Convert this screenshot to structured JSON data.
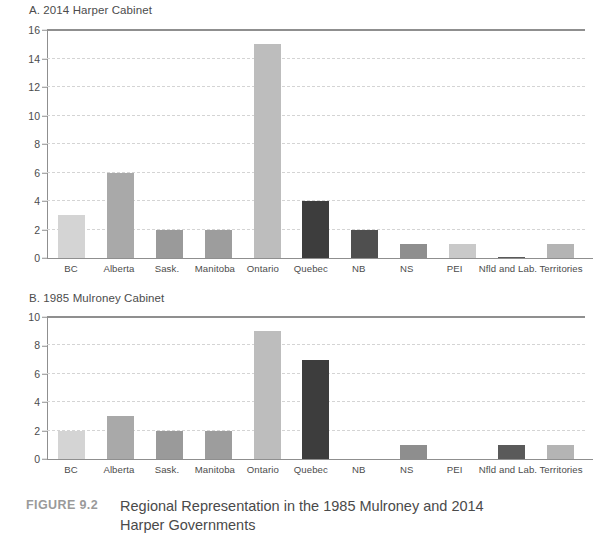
{
  "figure": {
    "label": "FIGURE 9.2",
    "caption": "Regional Representation in the 1985 Mulroney and 2014 Harper Governments"
  },
  "chart_data": [
    {
      "type": "bar",
      "panel": "A",
      "title": "A. 2014 Harper Cabinet",
      "categories": [
        "BC",
        "Alberta",
        "Sask.",
        "Manitoba",
        "Ontario",
        "Quebec",
        "NB",
        "NS",
        "PEI",
        "Nfld and Lab.",
        "Territories"
      ],
      "values": [
        3,
        6,
        2,
        2,
        15,
        4,
        2,
        1,
        1,
        0.1,
        1
      ],
      "colors": [
        "#d4d4d4",
        "#a9a9a9",
        "#9a9a9a",
        "#9d9d9d",
        "#bdbdbd",
        "#3d3d3d",
        "#4f4f4f",
        "#8e8e8e",
        "#c9c9c9",
        "#5a5a5a",
        "#b4b4b4"
      ],
      "xlabel": "",
      "ylabel": "",
      "ylim": [
        0,
        16
      ],
      "yticks": [
        0,
        2,
        4,
        6,
        8,
        10,
        12,
        14,
        16
      ],
      "grid": true,
      "legend": "none"
    },
    {
      "type": "bar",
      "panel": "B",
      "title": "B. 1985 Mulroney Cabinet",
      "categories": [
        "BC",
        "Alberta",
        "Sask.",
        "Manitoba",
        "Ontario",
        "Quebec",
        "NB",
        "NS",
        "PEI",
        "Nfld and Lab.",
        "Territories"
      ],
      "values": [
        2,
        3,
        2,
        2,
        9,
        7,
        0,
        1,
        0,
        1,
        1
      ],
      "colors": [
        "#d4d4d4",
        "#a9a9a9",
        "#9a9a9a",
        "#9d9d9d",
        "#bdbdbd",
        "#3d3d3d",
        "#4f4f4f",
        "#8e8e8e",
        "#c9c9c9",
        "#5a5a5a",
        "#b4b4b4"
      ],
      "xlabel": "",
      "ylabel": "",
      "ylim": [
        0,
        10
      ],
      "yticks": [
        0,
        2,
        4,
        6,
        8,
        10
      ],
      "grid": true,
      "legend": "none"
    }
  ]
}
